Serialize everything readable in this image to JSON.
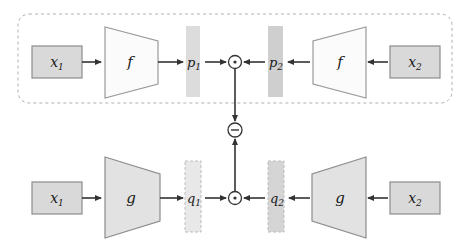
{
  "colors": {
    "background": "#ffffff",
    "stroke": "#4d4d4d",
    "box_border": "#8c8c8c",
    "box_fill": "#d9d9d9",
    "trapezoid_f_fill": "#fbfbfb",
    "trapezoid_f_border": "#9a9a9a",
    "trapezoid_g_fill": "#e2e2e2",
    "trapezoid_g_border": "#8c8c8c",
    "bar_p1_fill": "#dcdcdc",
    "bar_p2_fill": "#cfcfcf",
    "bar_q1_fill": "#e8e8e8",
    "bar_q2_fill": "#d5d5d5",
    "bar_q_border": "#bdbdbd",
    "dashed_group_border": "#b0b0b0",
    "arrow": "#333333",
    "node_fill": "#ffffff",
    "node_border": "#333333",
    "label_text": "#1a1a1a"
  },
  "top_branch": {
    "group_label": "",
    "left_input": {
      "base": "x",
      "sub": "1"
    },
    "right_input": {
      "base": "x",
      "sub": "2"
    },
    "left_encoder": "f",
    "right_encoder": "f",
    "left_feature": {
      "base": "p",
      "sub": "1"
    },
    "right_feature": {
      "base": "p",
      "sub": "2"
    },
    "combine_op": "elementwise-product"
  },
  "bottom_branch": {
    "left_input": {
      "base": "x",
      "sub": "1"
    },
    "right_input": {
      "base": "x",
      "sub": "2"
    },
    "left_encoder": "g",
    "right_encoder": "g",
    "left_feature": {
      "base": "q",
      "sub": "1"
    },
    "right_feature": {
      "base": "q",
      "sub": "2"
    },
    "combine_op": "elementwise-product"
  },
  "merge": {
    "op": "subtract",
    "symbol": "minus-circle"
  }
}
